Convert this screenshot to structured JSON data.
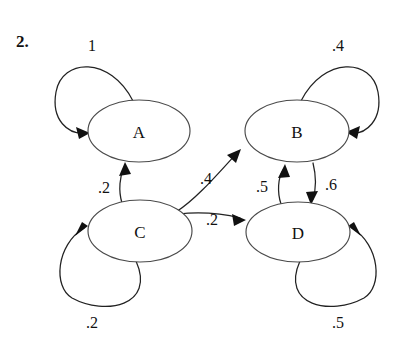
{
  "figure": {
    "problem_number": "2.",
    "caption": "",
    "kind": "markov-chain-state-diagram"
  },
  "nodes": [
    {
      "id": "A",
      "label": "A",
      "cx": 139,
      "cy": 131,
      "rx": 51,
      "ry": 31
    },
    {
      "id": "B",
      "label": "B",
      "cx": 297,
      "cy": 131,
      "rx": 52,
      "ry": 31
    },
    {
      "id": "C",
      "label": "C",
      "cx": 140,
      "cy": 231,
      "rx": 52,
      "ry": 31
    },
    {
      "id": "D",
      "label": "D",
      "cx": 298,
      "cy": 232,
      "rx": 52,
      "ry": 30
    }
  ],
  "edges": [
    {
      "id": "A-A",
      "from": "A",
      "to": "A",
      "weight": "1",
      "label_x": 92,
      "label_y": 45
    },
    {
      "id": "B-B",
      "from": "B",
      "to": "B",
      "weight": ".4",
      "label_x": 338,
      "label_y": 45
    },
    {
      "id": "C-C",
      "from": "C",
      "to": "C",
      "weight": ".2",
      "label_x": 92,
      "label_y": 322
    },
    {
      "id": "D-D",
      "from": "D",
      "to": "D",
      "weight": ".5",
      "label_x": 338,
      "label_y": 322
    },
    {
      "id": "C-A",
      "from": "C",
      "to": "A",
      "weight": ".2",
      "label_x": 104,
      "label_y": 187
    },
    {
      "id": "C-B",
      "from": "C",
      "to": "B",
      "weight": ".4",
      "label_x": 206,
      "label_y": 178
    },
    {
      "id": "C-D",
      "from": "C",
      "to": "D",
      "weight": ".2",
      "label_x": 212,
      "label_y": 219
    },
    {
      "id": "D-B",
      "from": "D",
      "to": "B",
      "weight": ".5",
      "label_x": 262,
      "label_y": 186
    },
    {
      "id": "B-D",
      "from": "B",
      "to": "D",
      "weight": ".6",
      "label_x": 331,
      "label_y": 184
    }
  ],
  "colors": {
    "background": "#ffffff",
    "stroke": "#222222",
    "node_stroke": "#4a4a4a",
    "text": "#111111"
  }
}
